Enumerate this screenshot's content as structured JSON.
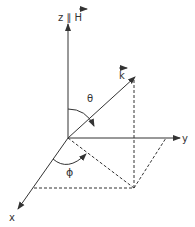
{
  "diagram": {
    "labels": {
      "z_axis": "z ∥ H",
      "z_prefix": "z ∥ ",
      "z_vector": "H",
      "y_axis": "y",
      "x_axis": "x",
      "k_vector": "k",
      "theta": "θ",
      "phi": "ϕ"
    },
    "colors": {
      "line": "#333333",
      "background": "#ffffff"
    }
  }
}
